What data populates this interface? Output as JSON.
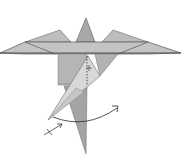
{
  "diagram": {
    "type": "origami-fold-instruction",
    "colors": {
      "background": "#ffffff",
      "paper_light": "#d6d6d6",
      "paper_mid": "#b8b8b8",
      "paper_dark": "#9e9e9e",
      "edge": "#4a4a4a",
      "arrow": "#2a2a2a"
    },
    "symbols": [
      {
        "name": "swing-arrow",
        "meaning": "curved arrow showing flap rotation"
      },
      {
        "name": "dotted-fold-line",
        "meaning": "valley fold / hidden edge"
      },
      {
        "name": "pivot-mark",
        "meaning": "small x pivot point"
      },
      {
        "name": "fold-direction-arrow",
        "meaning": "short arrow with cross indicating push/fold"
      }
    ]
  }
}
